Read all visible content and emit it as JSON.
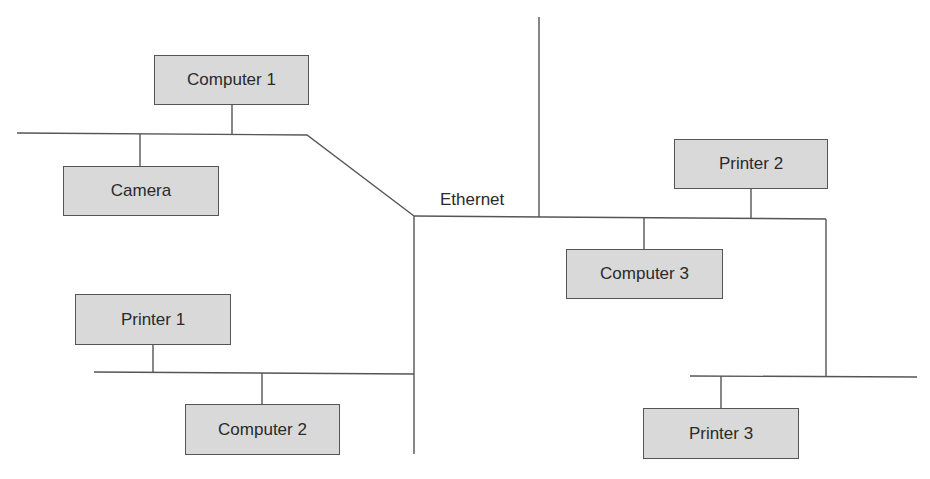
{
  "diagram": {
    "network_label": "Ethernet",
    "colors": {
      "node_fill": "#d9d9d9",
      "node_border": "#555555",
      "line": "#555555",
      "text": "#2a2a2a"
    },
    "nodes": [
      {
        "id": "computer-1",
        "label": "Computer 1",
        "x": 154,
        "y": 55,
        "w": 155,
        "h": 50
      },
      {
        "id": "camera",
        "label": "Camera",
        "x": 63,
        "y": 166,
        "w": 156,
        "h": 50
      },
      {
        "id": "printer-1",
        "label": "Printer 1",
        "x": 75,
        "y": 294,
        "w": 156,
        "h": 51
      },
      {
        "id": "computer-2",
        "label": "Computer 2",
        "x": 185,
        "y": 404,
        "w": 155,
        "h": 51
      },
      {
        "id": "computer-3",
        "label": "Computer 3",
        "x": 566,
        "y": 249,
        "w": 157,
        "h": 50
      },
      {
        "id": "printer-2",
        "label": "Printer 2",
        "x": 674,
        "y": 139,
        "w": 154,
        "h": 50
      },
      {
        "id": "printer-3",
        "label": "Printer 3",
        "x": 643,
        "y": 408,
        "w": 156,
        "h": 51
      }
    ],
    "edges": [
      {
        "from": "computer-1",
        "to": "segment-top-left"
      },
      {
        "from": "camera",
        "to": "segment-top-left"
      },
      {
        "from": "printer-1",
        "to": "segment-bottom-left"
      },
      {
        "from": "computer-2",
        "to": "segment-bottom-left"
      },
      {
        "from": "computer-3",
        "to": "ethernet-backbone"
      },
      {
        "from": "printer-2",
        "to": "ethernet-backbone"
      },
      {
        "from": "printer-3",
        "to": "segment-bottom-right"
      }
    ]
  }
}
